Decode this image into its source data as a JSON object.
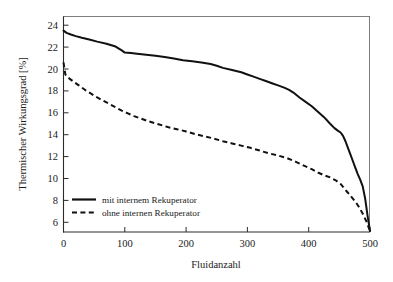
{
  "chart_data": {
    "type": "line",
    "title": "",
    "subtitle": "",
    "xlabel": "Fluidanzahl",
    "ylabel": "Thermischer Wirkungsgrad [%]",
    "xlim": [
      0,
      500
    ],
    "ylim": [
      5,
      25
    ],
    "xticks": [
      0,
      100,
      200,
      300,
      400,
      500
    ],
    "xticklabels": [
      "0",
      "100",
      "200",
      "300",
      "400",
      "500"
    ],
    "yticks": [
      6,
      8,
      10,
      12,
      14,
      16,
      18,
      20,
      22,
      24
    ],
    "yticklabels": [
      "6",
      "8",
      "10",
      "12",
      "14",
      "16",
      "18",
      "20",
      "22",
      "24"
    ],
    "grid": false,
    "legend_position": "lower-left-inside",
    "line_color": "#111111",
    "axis_color": "#2b2b2b",
    "background": "#ffffff",
    "series": [
      {
        "name": "mit internem Rekuperator",
        "style": "solid",
        "x": [
          0,
          5,
          12,
          20,
          30,
          42,
          55,
          70,
          85,
          95,
          100,
          110,
          120,
          135,
          150,
          165,
          180,
          195,
          210,
          225,
          240,
          250,
          260,
          275,
          290,
          300,
          310,
          320,
          330,
          340,
          350,
          360,
          368,
          375,
          385,
          395,
          405,
          415,
          425,
          435,
          442,
          448,
          452,
          456,
          460,
          464,
          468,
          472,
          476,
          480,
          484,
          488,
          492,
          496,
          500
        ],
        "y": [
          23.5,
          23.3,
          23.15,
          23.0,
          22.85,
          22.7,
          22.5,
          22.3,
          22.05,
          21.7,
          21.5,
          21.45,
          21.4,
          21.3,
          21.2,
          21.1,
          20.95,
          20.8,
          20.7,
          20.6,
          20.45,
          20.3,
          20.1,
          19.9,
          19.7,
          19.5,
          19.3,
          19.1,
          18.9,
          18.7,
          18.5,
          18.3,
          18.1,
          17.85,
          17.4,
          17.0,
          16.6,
          16.1,
          15.6,
          15.0,
          14.6,
          14.35,
          14.2,
          13.9,
          13.4,
          12.8,
          12.2,
          11.6,
          11.0,
          10.4,
          9.9,
          9.3,
          8.2,
          6.6,
          5.2
        ]
      },
      {
        "name": "ohne internen Rekuperator",
        "style": "dashed",
        "x": [
          0,
          3,
          8,
          15,
          25,
          35,
          45,
          55,
          65,
          75,
          85,
          95,
          105,
          115,
          125,
          140,
          155,
          170,
          185,
          200,
          215,
          230,
          245,
          260,
          275,
          290,
          305,
          320,
          335,
          350,
          365,
          380,
          395,
          405,
          415,
          425,
          435,
          445,
          452,
          458,
          464,
          470,
          476,
          482,
          488,
          494,
          500
        ],
        "y": [
          20.6,
          19.5,
          19.2,
          18.9,
          18.5,
          18.1,
          17.75,
          17.4,
          17.1,
          16.8,
          16.5,
          16.2,
          15.95,
          15.7,
          15.5,
          15.2,
          14.95,
          14.7,
          14.5,
          14.3,
          14.05,
          13.85,
          13.65,
          13.4,
          13.2,
          13.0,
          12.8,
          12.55,
          12.3,
          12.1,
          11.85,
          11.5,
          11.1,
          10.85,
          10.55,
          10.3,
          10.1,
          9.8,
          9.5,
          9.1,
          8.7,
          8.3,
          7.9,
          7.4,
          6.8,
          6.1,
          5.2
        ]
      }
    ]
  },
  "legend": {
    "items": [
      {
        "label": "mit internem Rekuperator",
        "style": "solid"
      },
      {
        "label": "ohne internen Rekuperator",
        "style": "dashed"
      }
    ]
  }
}
